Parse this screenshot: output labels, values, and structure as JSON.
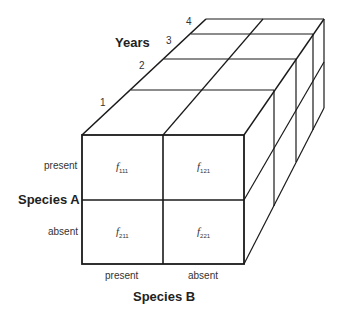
{
  "diagram": {
    "type": "three-way contingency table cube",
    "years_axis": {
      "title": "Years",
      "ticks": [
        "1",
        "2",
        "3",
        "4"
      ]
    },
    "species_a_axis": {
      "title": "Species A",
      "levels": [
        "present",
        "absent"
      ]
    },
    "species_b_axis": {
      "title": "Species B",
      "levels": [
        "present",
        "absent"
      ]
    },
    "cells": [
      {
        "symbol": "f",
        "subscript": "111"
      },
      {
        "symbol": "f",
        "subscript": "121"
      },
      {
        "symbol": "f",
        "subscript": "211"
      },
      {
        "symbol": "f",
        "subscript": "221"
      }
    ],
    "line_color": "#1a1a1a"
  }
}
